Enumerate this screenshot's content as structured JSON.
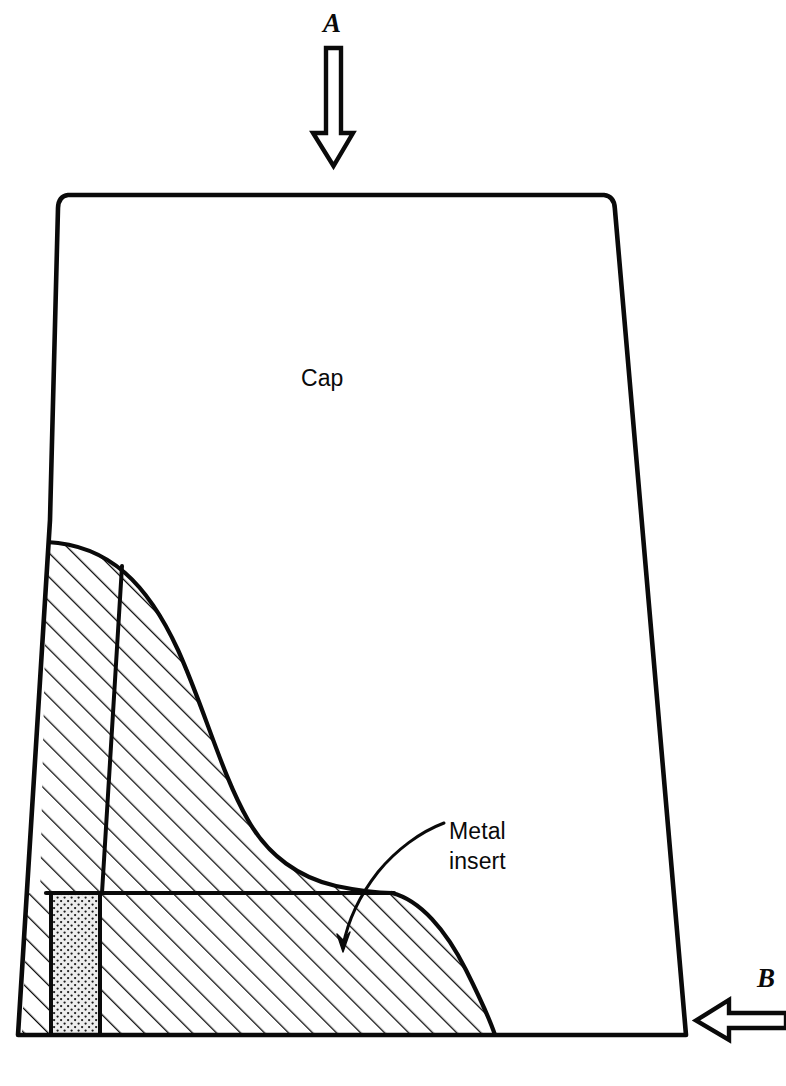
{
  "figure": {
    "kind": "engineering-cross-section",
    "width": 786,
    "height": 1086,
    "background_color": "#ffffff",
    "line_color": "#0a0a0a"
  },
  "labels": {
    "cap": "Cap",
    "metal_insert": "Metal\ninsert",
    "load_a": "A",
    "load_b": "B"
  },
  "arrows": [
    {
      "name": "load-arrow-a",
      "label": "A",
      "direction": "down",
      "meaning": "axial load applied to top of cap"
    },
    {
      "name": "load-arrow-b",
      "label": "B",
      "direction": "left",
      "meaning": "lateral load applied to side of cap"
    }
  ],
  "regions": [
    {
      "name": "cap-body",
      "label": "Cap",
      "fill": "none",
      "pattern": "plain"
    },
    {
      "name": "metal-insert-upper",
      "fill": "#ffffff",
      "pattern": "diagonal-hatch"
    },
    {
      "name": "metal-insert-lower",
      "fill": "#ffffff",
      "pattern": "diagonal-hatch"
    },
    {
      "name": "insert-core",
      "fill": "#e8e8e8",
      "pattern": "stipple-dots"
    }
  ],
  "leader_line": {
    "name": "metal-insert-leader",
    "from_label": "Metal insert",
    "to_region": "metal-insert-lower",
    "has_arrowhead": true
  },
  "colors": {
    "ink": "#0a0a0a",
    "paper": "#ffffff",
    "stipple_fill": "#e9e9e9",
    "hatch_fill": "#ffffff"
  }
}
